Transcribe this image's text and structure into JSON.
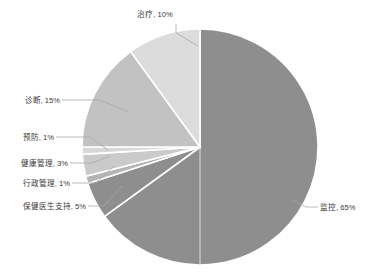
{
  "chart_data": {
    "type": "pie",
    "title": "",
    "subtitle": "",
    "xlabel": "",
    "ylabel": "",
    "legend_position": "none",
    "grid": false,
    "label_format": "{name}, {value}%",
    "start_angle_deg": 0,
    "direction": "clockwise",
    "categories": [
      "监控",
      "保健医生支持",
      "行政管理",
      "健康管理",
      "预防",
      "诊断",
      "治疗"
    ],
    "values": [
      65,
      5,
      1,
      3,
      1,
      15,
      10
    ],
    "total": 100,
    "colors": [
      "#8e8e8e",
      "#8e8e8e",
      "#b4b4b4",
      "#cacaca",
      "#d8d8d8",
      "#c2c2c2",
      "#dcdcdc"
    ],
    "slices": [
      {
        "name": "监控",
        "value": 65,
        "label": "监控, 65%",
        "color": "#8e8e8e",
        "label_side": "right"
      },
      {
        "name": "保健医生支持",
        "value": 5,
        "label": "保健医生支持, 5%",
        "color": "#8e8e8e",
        "label_side": "left"
      },
      {
        "name": "行政管理",
        "value": 1,
        "label": "行政管理, 1%",
        "color": "#b4b4b4",
        "label_side": "left"
      },
      {
        "name": "健康管理",
        "value": 3,
        "label": "健康管理, 3%",
        "color": "#cacaca",
        "label_side": "left"
      },
      {
        "name": "预防",
        "value": 1,
        "label": "预防, 1%",
        "color": "#d8d8d8",
        "label_side": "left"
      },
      {
        "name": "诊断",
        "value": 15,
        "label": "诊断, 15%",
        "color": "#c2c2c2",
        "label_side": "left"
      },
      {
        "name": "治疗",
        "value": 10,
        "label": "治疗, 10%",
        "color": "#dcdcdc",
        "label_side": "top"
      }
    ]
  },
  "labels": {
    "treatment": "治疗, 10%",
    "diagnosis": "诊断, 15%",
    "prevention": "预防, 1%",
    "health_management": "健康管理, 3%",
    "administration": "行政管理, 1%",
    "doctor_support": "保健医生支持, 5%",
    "monitoring": "监控, 65%"
  },
  "geometry": {
    "center_x": 200,
    "center_y": 147,
    "radius": 118
  },
  "style": {
    "background": "#ffffff",
    "separator": "#ffffff",
    "leader_line": "#a8a8a8",
    "text": "#3a3a3a"
  }
}
